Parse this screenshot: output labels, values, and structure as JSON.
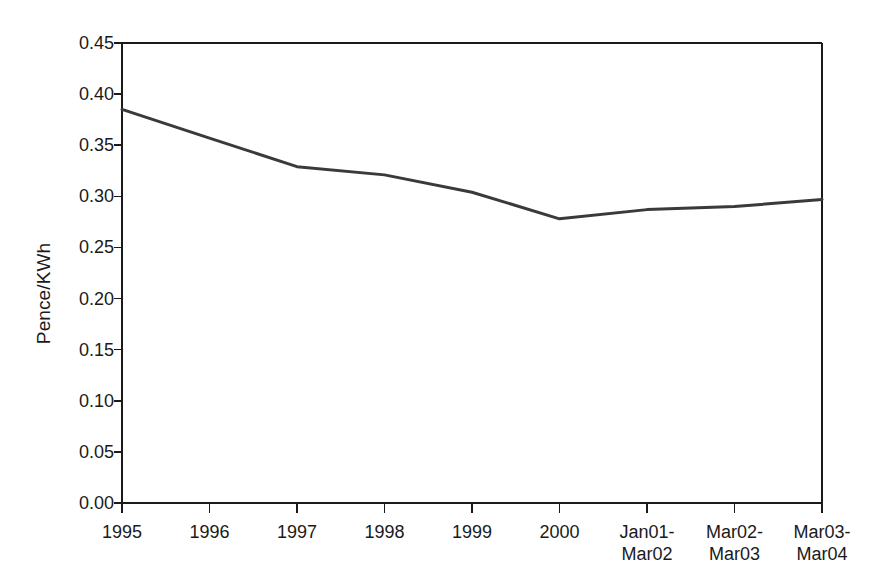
{
  "chart_data": {
    "type": "line",
    "title": "",
    "xlabel": "",
    "ylabel": "Pence/KWh",
    "categories": [
      "1995",
      "1996",
      "1997",
      "1998",
      "1999",
      "2000",
      "Jan01-Mar02",
      "Mar02-Mar03",
      "Mar03-Mar04"
    ],
    "x_tick_labels": [
      {
        "line1": "1995",
        "line2": ""
      },
      {
        "line1": "1996",
        "line2": ""
      },
      {
        "line1": "1997",
        "line2": ""
      },
      {
        "line1": "1998",
        "line2": ""
      },
      {
        "line1": "1999",
        "line2": ""
      },
      {
        "line1": "2000",
        "line2": ""
      },
      {
        "line1": "Jan01-",
        "line2": "Mar02"
      },
      {
        "line1": "Mar02-",
        "line2": "Mar03"
      },
      {
        "line1": "Mar03-",
        "line2": "Mar04"
      }
    ],
    "values": [
      0.385,
      0.357,
      0.329,
      0.321,
      0.304,
      0.278,
      0.287,
      0.29,
      0.297
    ],
    "series": [
      {
        "name": "Pence/KWh",
        "values": [
          0.385,
          0.357,
          0.329,
          0.321,
          0.304,
          0.278,
          0.287,
          0.29,
          0.297
        ]
      }
    ],
    "ylim": [
      0.0,
      0.45
    ],
    "y_ticks": [
      0.0,
      0.05,
      0.1,
      0.15,
      0.2,
      0.25,
      0.3,
      0.35,
      0.4,
      0.45
    ],
    "y_tick_labels": [
      "0.00",
      "0.05",
      "0.10",
      "0.15",
      "0.20",
      "0.25",
      "0.30",
      "0.35",
      "0.40",
      "0.45"
    ],
    "grid": false,
    "legend": false,
    "legend_position": "none",
    "line_color": "#3a3a3a",
    "axis_color": "#1a1a1a",
    "background_color": "#ffffff",
    "annotations": []
  }
}
